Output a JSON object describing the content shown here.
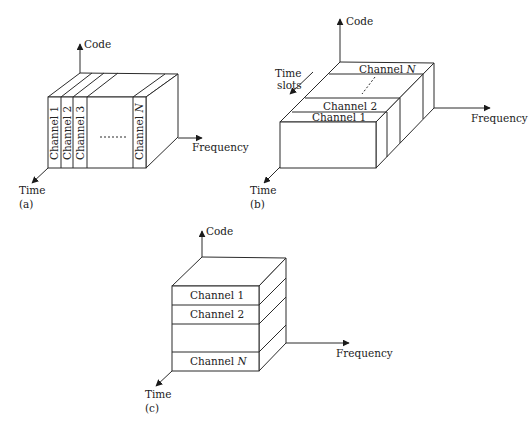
{
  "diagrams": {
    "a": {
      "caption": "(a)",
      "scheme": "FDMA",
      "axes": {
        "code": "Code",
        "frequency": "Frequency",
        "time": "Time"
      },
      "channels": [
        "Channel 1",
        "Channel 2",
        "Channel 3",
        "Channel N"
      ],
      "ellipsis": "......."
    },
    "b": {
      "caption": "(b)",
      "scheme": "TDMA",
      "axes": {
        "code": "Code",
        "frequency": "Frequency",
        "time": "Time"
      },
      "time_slots_label_line1": "Time",
      "time_slots_label_line2": "slots",
      "channels": [
        "Channel 1",
        "Channel 2",
        "Channel N"
      ]
    },
    "c": {
      "caption": "(c)",
      "scheme": "CDMA",
      "axes": {
        "code": "Code",
        "frequency": "Frequency",
        "time": "Time"
      },
      "channels": [
        "Channel 1",
        "Channel 2",
        "Channel N"
      ]
    }
  },
  "colors": {
    "line": "#2b2b2b",
    "text": "#222222",
    "background": "#ffffff"
  }
}
